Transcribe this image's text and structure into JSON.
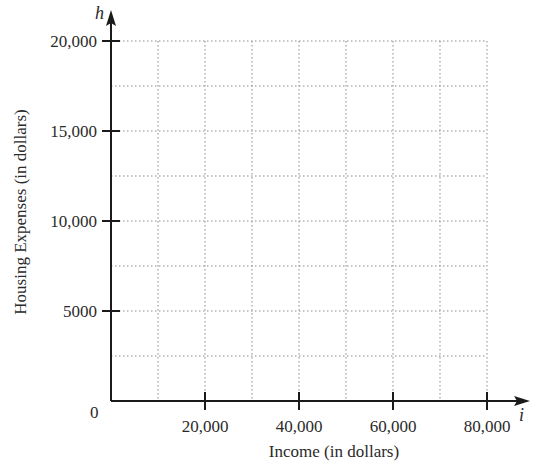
{
  "chart_data": {
    "type": "scatter",
    "title": "",
    "xlabel": "Income (in dollars)",
    "ylabel": "Housing Expenses (in dollars)",
    "x_variable": "i",
    "y_variable": "h",
    "xlim": [
      0,
      85000
    ],
    "ylim": [
      0,
      21000
    ],
    "x_grid_max": 80000,
    "y_grid_max": 20000,
    "x_grid_step": 10000,
    "y_grid_step": 2500,
    "x_ticks": [
      20000,
      40000,
      60000,
      80000
    ],
    "x_tick_labels": [
      "20,000",
      "40,000",
      "60,000",
      "80,000"
    ],
    "y_ticks": [
      5000,
      10000,
      15000,
      20000
    ],
    "y_tick_labels": [
      "5000",
      "10,000",
      "15,000",
      "20,000"
    ],
    "origin_label": "0",
    "grid": true,
    "grid_style": "dotted",
    "series": [],
    "legend": "none"
  }
}
